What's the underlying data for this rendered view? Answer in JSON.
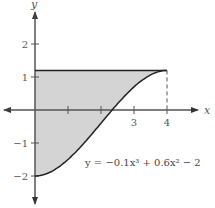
{
  "figure": {
    "axes": {
      "x_label": "x",
      "y_label": "y",
      "x_ticks": [
        {
          "value": 1,
          "label": ""
        },
        {
          "value": 2,
          "label": ""
        },
        {
          "value": 3,
          "label": "3"
        },
        {
          "value": 4,
          "label": "4"
        }
      ],
      "y_ticks": [
        {
          "value": 2,
          "label": "2"
        },
        {
          "value": 1,
          "label": "1"
        },
        {
          "value": -1,
          "label": "−1"
        },
        {
          "value": -2,
          "label": "−2"
        }
      ]
    },
    "curve": {
      "equation_label": "y = −0.1x³ + 0.6x² − 2",
      "x_range": [
        0,
        4
      ]
    },
    "upper_boundary": {
      "y": 1.2,
      "x_range": [
        0,
        4
      ]
    },
    "dashed_line": {
      "x": 4,
      "y_from": 0,
      "y_to": 1.2
    },
    "colors": {
      "shade": "#d4d4d4",
      "line": "#222222",
      "axis": "#555555"
    }
  }
}
